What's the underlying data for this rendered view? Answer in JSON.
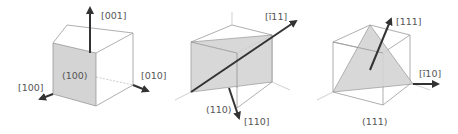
{
  "diagrams": [
    {
      "id": "cube-100",
      "plane_label": "(100)",
      "directions": [
        "[001]",
        "[010]",
        "[100]"
      ]
    },
    {
      "id": "cube-110",
      "plane_label": "(110)",
      "directions": [
        "[ī11]",
        "[110]"
      ]
    },
    {
      "id": "cube-111",
      "plane_label": "(111)",
      "directions": [
        "[111]",
        "[ī10]"
      ]
    }
  ],
  "colors": {
    "plane_fill": "#d4d4d4",
    "arrow": "#333333",
    "edge": "#9a9a9a",
    "text": "#555555"
  }
}
